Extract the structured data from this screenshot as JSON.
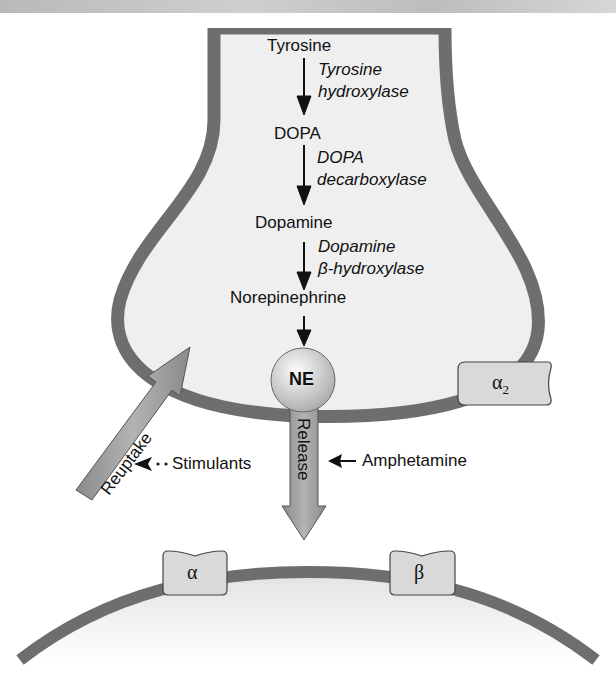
{
  "pathway": {
    "steps": [
      {
        "substrate": "Tyrosine",
        "enzyme_line1": "Tyrosine",
        "enzyme_line2": "hydroxylase"
      },
      {
        "substrate": "DOPA",
        "enzyme_line1": "DOPA",
        "enzyme_line2": "decarboxylase"
      },
      {
        "substrate": "Dopamine",
        "enzyme_line1": "Dopamine",
        "enzyme_line2": "β-hydroxylase"
      },
      {
        "substrate": "Norepinephrine"
      }
    ]
  },
  "vesicle": {
    "label": "NE"
  },
  "arrows": {
    "release": "Release",
    "reuptake": "Reuptake",
    "stimulants": "Stimulants",
    "amphetamine": "Amphetamine"
  },
  "receptors": {
    "presynaptic": {
      "symbol": "α",
      "subscript": "2"
    },
    "postsynaptic": [
      {
        "symbol": "α"
      },
      {
        "symbol": "β"
      }
    ]
  },
  "colors": {
    "membrane": "#6e6e6e",
    "cell_fill": "#efefef",
    "arrow_fill": "#9a9a9a",
    "receptor_fill": "#d9d9d9",
    "top_band": "#c4c4c4"
  }
}
